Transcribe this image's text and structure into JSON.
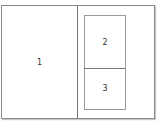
{
  "diagram": {
    "type": "layout-split",
    "panels": [
      {
        "id": "panel-1",
        "label": "1"
      },
      {
        "id": "panel-2",
        "label": "2"
      },
      {
        "id": "panel-3",
        "label": "3"
      }
    ],
    "colors": {
      "border": "#8a8a8a",
      "background": "#ffffff",
      "text": "#333333"
    }
  }
}
